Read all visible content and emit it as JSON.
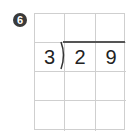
{
  "problem": {
    "number_badge": "6",
    "divisor": "3",
    "dividend_digits": [
      "2",
      "9"
    ],
    "grid": {
      "rows": 4,
      "cols": 3
    },
    "colors": {
      "grid_line": "#cfcfcf",
      "division_line": "#555555",
      "badge_bg": "#3a3a3a",
      "text": "#222222"
    }
  }
}
